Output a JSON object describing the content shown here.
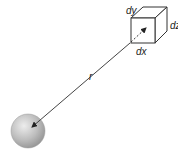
{
  "diagram": {
    "labels": {
      "distance": "r",
      "volume_dx": "dx",
      "volume_dy": "dy",
      "volume_dz": "dz"
    },
    "colors": {
      "line": "#444444",
      "cube_edge": "#333333",
      "cube_face": "#ffffff",
      "sphere_light": "#e6e6e6",
      "sphere_mid": "#b5b5b5",
      "sphere_dark": "#8a8a8a"
    },
    "elements": {
      "sphere": "point-mass-sphere",
      "cube": "volume-element-dxdydz",
      "vector": "distance-vector-r"
    }
  }
}
